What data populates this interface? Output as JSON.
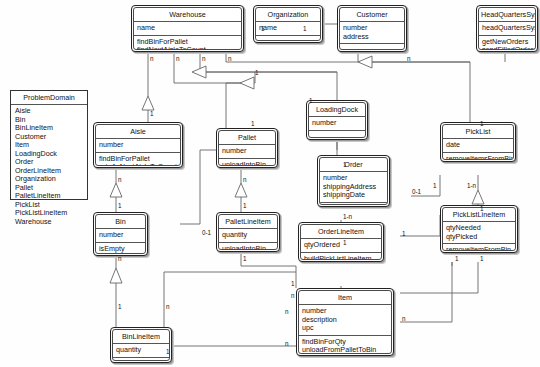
{
  "diagram": {
    "type": "uml-class-diagram",
    "background": "#ffffff",
    "line_color": "#555555",
    "text_color": "#111111"
  },
  "package": {
    "name": "ProblemDomain",
    "classes": [
      "Aisle",
      "Bin",
      "BinLineItem",
      "Customer",
      "Item",
      "LoadingDock",
      "Order",
      "OrderLineItem",
      "Organization",
      "Pallet",
      "PalletLineItem",
      "PickList",
      "PickListLineItem",
      "Warehouse"
    ]
  },
  "classes": [
    {
      "id": "warehouse",
      "name": "Warehouse",
      "attributes": [
        "name"
      ],
      "operations": [
        "findBinForPallet",
        "findNextAisleToCount"
      ]
    },
    {
      "id": "organization",
      "name": "Organization",
      "attributes": [
        "name"
      ],
      "operations": []
    },
    {
      "id": "customer",
      "name": "Customer",
      "attributes": [
        "number",
        "address"
      ],
      "operations": []
    },
    {
      "id": "headquarterssys",
      "name": "HeadQuartersSys",
      "attributes": [
        "headQuartersSysSI"
      ],
      "operations": [
        "getNewOrders",
        "sendFilledOrders"
      ]
    },
    {
      "id": "aisle",
      "name": "Aisle",
      "attributes": [
        "number"
      ],
      "operations": [
        "findBinForPallet",
        "rateAsNextAisleToCount"
      ]
    },
    {
      "id": "pallet",
      "name": "Pallet",
      "attributes": [
        "number"
      ],
      "operations": [
        "unloadIntoBin"
      ]
    },
    {
      "id": "loadingdock",
      "name": "LoadingDock",
      "attributes": [
        "number"
      ],
      "operations": []
    },
    {
      "id": "picklist",
      "name": "PickList",
      "attributes": [
        "date"
      ],
      "operations": [
        "removeItemsFromBins"
      ]
    },
    {
      "id": "order",
      "name": "Order",
      "attributes": [
        "number",
        "shippingAddress",
        "shippingDate"
      ],
      "operations": [
        "buildPickList"
      ]
    },
    {
      "id": "bin",
      "name": "Bin",
      "attributes": [
        "number"
      ],
      "operations": [
        "isEmpty",
        "addItems"
      ]
    },
    {
      "id": "palletlineitem",
      "name": "PalletLineItem",
      "attributes": [
        "quantity"
      ],
      "operations": [
        "unloadIntoBin"
      ]
    },
    {
      "id": "orderlineitem",
      "name": "OrderLineItem",
      "attributes": [
        "qtyOrdered"
      ],
      "operations": [
        "buildPickListLineItem"
      ]
    },
    {
      "id": "picklistlineitem",
      "name": "PickListLineItem",
      "attributes": [
        "qtyNeeded",
        "qtyPicked"
      ],
      "operations": [
        "removeItemFromBin"
      ]
    },
    {
      "id": "item",
      "name": "Item",
      "attributes": [
        "number",
        "description",
        "upc"
      ],
      "operations": [
        "findBinForQty",
        "unloadFromPalletToBin",
        "howManyAvailable"
      ]
    },
    {
      "id": "binlineitem",
      "name": "BinLineItem",
      "attributes": [
        "quantity"
      ],
      "operations": []
    }
  ],
  "multiplicities": [
    {
      "id": "m1",
      "label": "n",
      "x": 150,
      "y": 55
    },
    {
      "id": "m2",
      "label": "n",
      "x": 176,
      "y": 55
    },
    {
      "id": "m3",
      "label": "n",
      "x": 202,
      "y": 55
    },
    {
      "id": "m4",
      "label": "n",
      "x": 228,
      "y": 55
    },
    {
      "id": "m5",
      "label": "1",
      "x": 150,
      "y": 110
    },
    {
      "id": "m6",
      "label": "1",
      "x": 251,
      "y": 120
    },
    {
      "id": "m7",
      "label": "1",
      "x": 255,
      "y": 69
    },
    {
      "id": "m8",
      "label": "1",
      "x": 309,
      "y": 97
    },
    {
      "id": "m9",
      "label": "1",
      "x": 261,
      "y": 25
    },
    {
      "id": "m10",
      "label": "1",
      "x": 303,
      "y": 25
    },
    {
      "id": "m11",
      "label": "n",
      "x": 407,
      "y": 55
    },
    {
      "id": "m12",
      "label": "1",
      "x": 480,
      "y": 120
    },
    {
      "id": "m13",
      "label": "n",
      "x": 118,
      "y": 176
    },
    {
      "id": "m14",
      "label": "1",
      "x": 118,
      "y": 202
    },
    {
      "id": "m15",
      "label": "n",
      "x": 243,
      "y": 176
    },
    {
      "id": "m16",
      "label": "1",
      "x": 243,
      "y": 202
    },
    {
      "id": "m17",
      "label": "0-1",
      "x": 202,
      "y": 229
    },
    {
      "id": "m18",
      "label": "n",
      "x": 118,
      "y": 255
    },
    {
      "id": "m19",
      "label": "1",
      "x": 118,
      "y": 303
    },
    {
      "id": "m20",
      "label": "n",
      "x": 166,
      "y": 303
    },
    {
      "id": "m21",
      "label": "1",
      "x": 243,
      "y": 255
    },
    {
      "id": "m22",
      "label": "1",
      "x": 343,
      "y": 161
    },
    {
      "id": "m23",
      "label": "0-1",
      "x": 412,
      "y": 188
    },
    {
      "id": "m24",
      "label": "1",
      "x": 433,
      "y": 182
    },
    {
      "id": "m25",
      "label": "1-n",
      "x": 467,
      "y": 182
    },
    {
      "id": "m26",
      "label": "1",
      "x": 480,
      "y": 205
    },
    {
      "id": "m27",
      "label": "1-n",
      "x": 343,
      "y": 213
    },
    {
      "id": "m28",
      "label": "1",
      "x": 343,
      "y": 239
    },
    {
      "id": "m29",
      "label": "1",
      "x": 402,
      "y": 230
    },
    {
      "id": "m30",
      "label": "1",
      "x": 291,
      "y": 280
    },
    {
      "id": "m31",
      "label": "n",
      "x": 291,
      "y": 292
    },
    {
      "id": "m32",
      "label": "n",
      "x": 285,
      "y": 308
    },
    {
      "id": "m33",
      "label": "n",
      "x": 285,
      "y": 340
    },
    {
      "id": "m34",
      "label": "1",
      "x": 166,
      "y": 348
    },
    {
      "id": "m35",
      "label": "n",
      "x": 402,
      "y": 315
    },
    {
      "id": "m36",
      "label": "1",
      "x": 455,
      "y": 255
    },
    {
      "id": "m37",
      "label": "1",
      "x": 480,
      "y": 255
    }
  ]
}
